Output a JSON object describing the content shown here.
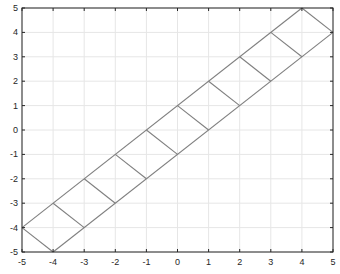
{
  "chart_data": {
    "type": "line",
    "title": "",
    "xlabel": "",
    "ylabel": "",
    "xlim": [
      -5,
      5
    ],
    "ylim": [
      -5,
      5
    ],
    "grid": true,
    "legend": null,
    "x_ticks": [
      -5,
      -4,
      -3,
      -2,
      -1,
      0,
      1,
      2,
      3,
      4,
      5
    ],
    "y_ticks": [
      -5,
      -4,
      -3,
      -2,
      -1,
      0,
      1,
      2,
      3,
      4,
      5
    ],
    "x_tick_labels": [
      "-5",
      "-4",
      "-3",
      "-2",
      "-1",
      "0",
      "1",
      "2",
      "3",
      "4",
      "5"
    ],
    "y_tick_labels": [
      "-5",
      "-4",
      "-3",
      "-2",
      "-1",
      "0",
      "1",
      "2",
      "3",
      "4",
      "5"
    ],
    "series": [
      {
        "name": "upper-edge",
        "x": [
          -5,
          4
        ],
        "y": [
          -4,
          5
        ]
      },
      {
        "name": "lower-edge",
        "x": [
          -4,
          5
        ],
        "y": [
          -5,
          4
        ]
      },
      {
        "name": "rung-1",
        "x": [
          -5,
          -4
        ],
        "y": [
          -4,
          -5
        ]
      },
      {
        "name": "rung-2",
        "x": [
          -4,
          -3
        ],
        "y": [
          -3,
          -4
        ]
      },
      {
        "name": "rung-3",
        "x": [
          -3,
          -2
        ],
        "y": [
          -2,
          -3
        ]
      },
      {
        "name": "rung-4",
        "x": [
          -2,
          -1
        ],
        "y": [
          -1,
          -2
        ]
      },
      {
        "name": "rung-5",
        "x": [
          -1,
          0
        ],
        "y": [
          0,
          -1
        ]
      },
      {
        "name": "rung-6",
        "x": [
          0,
          1
        ],
        "y": [
          1,
          0
        ]
      },
      {
        "name": "rung-7",
        "x": [
          1,
          2
        ],
        "y": [
          2,
          1
        ]
      },
      {
        "name": "rung-8",
        "x": [
          2,
          3
        ],
        "y": [
          3,
          2
        ]
      },
      {
        "name": "rung-9",
        "x": [
          3,
          4
        ],
        "y": [
          4,
          3
        ]
      },
      {
        "name": "rung-10",
        "x": [
          4,
          5
        ],
        "y": [
          5,
          4
        ]
      }
    ],
    "line_color": "#7f7f7f"
  },
  "style": {
    "axis_color": "#262626",
    "grid_color": "#e6e6e6",
    "line_color": "#7f7f7f"
  }
}
